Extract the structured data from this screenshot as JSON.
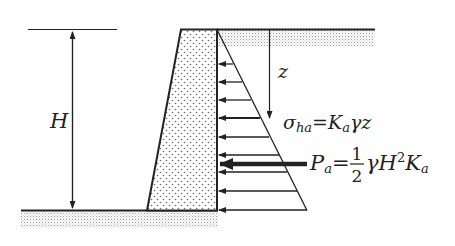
{
  "diagram": {
    "labels": {
      "height": "H",
      "depth": "z",
      "stress_formula": {
        "lhs_symbol": "σ",
        "lhs_sub": "ha",
        "equals": "=",
        "rhs_K": "K",
        "rhs_K_sub": "a",
        "rhs_rest": "γz"
      },
      "force_formula": {
        "lhs_symbol": "P",
        "lhs_sub": "a",
        "equals": "=",
        "frac_num": "1",
        "frac_den": "2",
        "gamma": "γ",
        "H": "H",
        "H_exp": "2",
        "K": "K",
        "K_sub": "a"
      }
    },
    "colors": {
      "line": "#222222",
      "wall_fill": "#f4f4f4",
      "soil_hatch": "#bdbdbd"
    }
  }
}
